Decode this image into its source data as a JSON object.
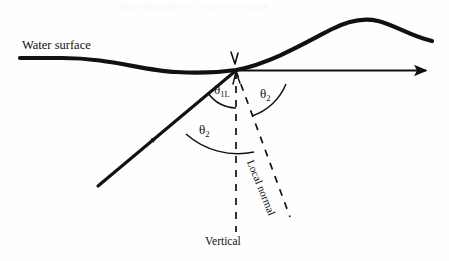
{
  "figure": {
    "type": "optics-ray-diagram",
    "background_color": "#fefefe",
    "ink_color": "#111111",
    "bleed_through_text": "bleed-through text from reverse page",
    "labels": {
      "water_surface": "Water surface",
      "vertical": "Vertical",
      "local_normal": "Local normal",
      "theta_1l_symbol": "θ",
      "theta_1l_subscript": "1L",
      "theta_2_symbol": "θ",
      "theta_2_subscript": "2"
    },
    "elements": {
      "water_surface_curve": "wavy-water-surface-curve",
      "incident_ray": "incident-ray-arrow",
      "horizontal_ray": "horizontal-reference-ray-arrow",
      "vertical_dashed_line": "vertical-dashed-line",
      "local_normal_dashed_line": "local-normal-dashed-line",
      "angle_arc_theta_1l": "angle-arc-theta-1l",
      "angle_arc_theta_2_upper": "angle-arc-theta-2-upper",
      "angle_arc_theta_2_lower": "angle-arc-theta-2-lower",
      "intersection_tick": "intersection-tick-mark",
      "intersection_point": "ray-surface-intersection-point"
    }
  }
}
